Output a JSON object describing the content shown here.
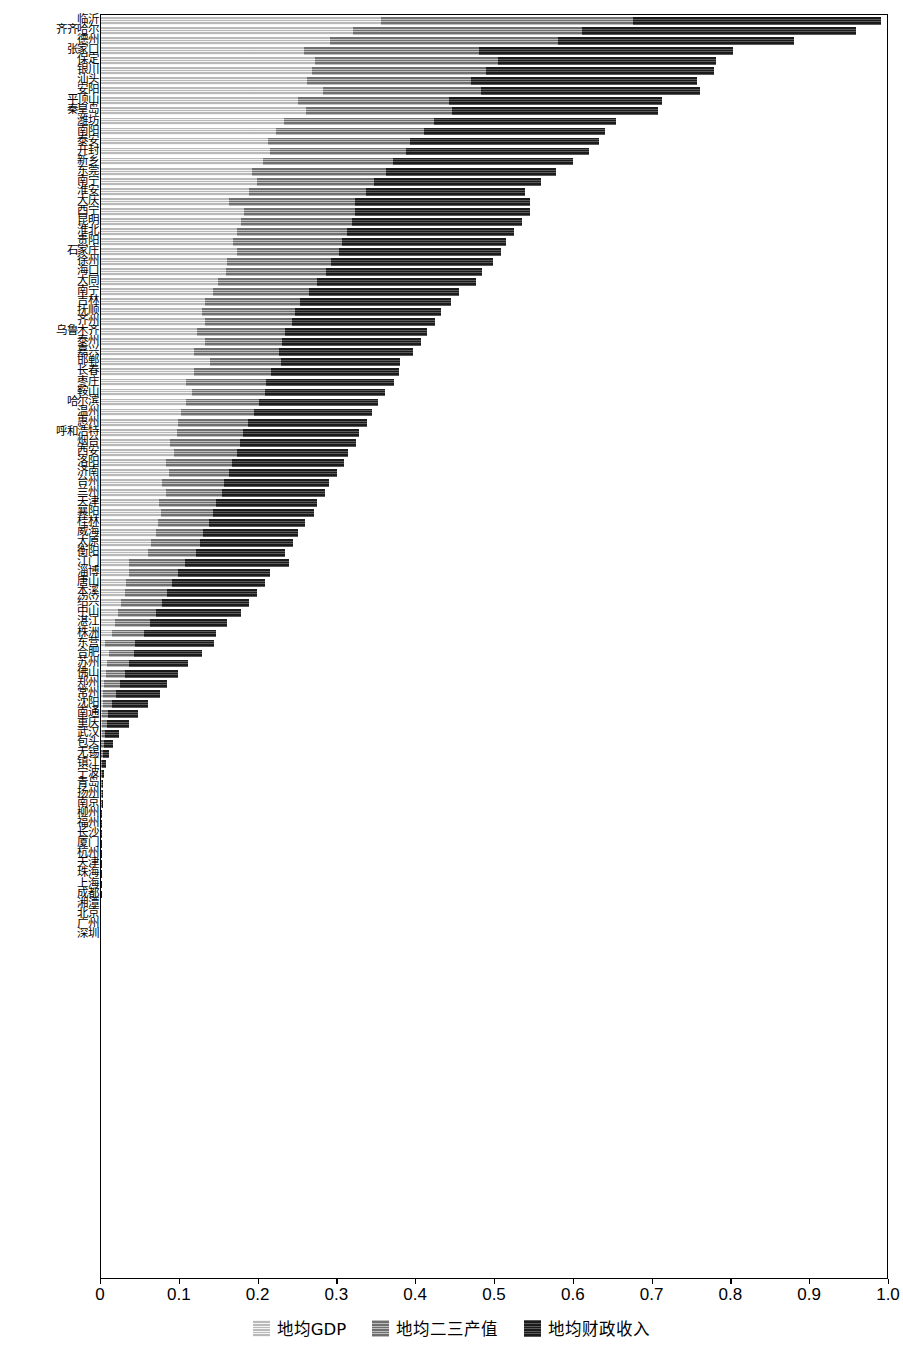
{
  "chart_data": {
    "type": "bar",
    "orientation": "horizontal",
    "stacked": true,
    "title": "",
    "subtitle": "",
    "xlabel": "",
    "ylabel": "",
    "xlim": [
      0,
      1.0
    ],
    "xticks": [
      0,
      0.1,
      0.2,
      0.3,
      0.4,
      0.5,
      0.6,
      0.7,
      0.8,
      0.9,
      1.0
    ],
    "xticklabels": [
      "0",
      "0.1",
      "0.2",
      "0.3",
      "0.4",
      "0.5",
      "0.6",
      "0.7",
      "0.8",
      "0.9",
      "1.0"
    ],
    "grid": false,
    "legend_position": "bottom-center",
    "legend": [
      {
        "name": "地均GDP",
        "color": "#b9b9b9",
        "hatch": "horizontal-lines"
      },
      {
        "name": "地均二三产值",
        "color": "#6f6f6f",
        "hatch": "horizontal-lines"
      },
      {
        "name": "地均财政收入",
        "color": "#1b1b1b",
        "hatch": "horizontal-lines"
      }
    ],
    "categories": [
      "临沂",
      "齐齐哈尔",
      "德州",
      "张家口",
      "保定",
      "银川",
      "汕头",
      "安阳",
      "平顶山",
      "秦皇岛",
      "潍坊",
      "南阳",
      "泰安",
      "开封",
      "新乡",
      "东莞",
      "南宁",
      "淮安",
      "大庆",
      "西宁",
      "昆明",
      "淮北",
      "贵阳",
      "石家庄",
      "徐州",
      "海口",
      "大同",
      "南宁",
      "吉林",
      "抚顺",
      "齐州",
      "乌鲁木齐",
      "泰州",
      "嘉兴",
      "邯郸",
      "长春",
      "枣庄",
      "鞍山",
      "哈尔滨",
      "温州",
      "惠州",
      "呼和浩特",
      "烟台",
      "西安",
      "洛阳",
      "济南",
      "台州",
      "兰州",
      "天津",
      "襄阳",
      "桂林",
      "威海",
      "太原",
      "衡阳",
      "江门",
      "淄博",
      "唐山",
      "本溪",
      "绍兴",
      "中山",
      "湛江",
      "株洲",
      "东营",
      "合肥",
      "苏州",
      "佛山",
      "郑州",
      "常州",
      "沈阳",
      "南通",
      "重庆",
      "武汉",
      "包头",
      "无锡",
      "镇江",
      "宁波",
      "青岛",
      "扬州",
      "南京",
      "柳州",
      "福州",
      "长沙",
      "厦门",
      "杭州",
      "天津",
      "珠海",
      "上海",
      "成都",
      "湘潭",
      "北京",
      "广州",
      "深圳"
    ],
    "series": [
      {
        "name": "地均GDP",
        "color": "#b9b9b9",
        "values": [
          0.355,
          0.32,
          0.29,
          0.258,
          0.272,
          0.268,
          0.262,
          0.282,
          0.25,
          0.26,
          0.232,
          0.222,
          0.212,
          0.215,
          0.205,
          0.192,
          0.198,
          0.188,
          0.162,
          0.182,
          0.178,
          0.172,
          0.168,
          0.172,
          0.16,
          0.158,
          0.148,
          0.142,
          0.132,
          0.128,
          0.132,
          0.122,
          0.132,
          0.118,
          0.138,
          0.118,
          0.108,
          0.116,
          0.108,
          0.102,
          0.098,
          0.096,
          0.088,
          0.092,
          0.082,
          0.086,
          0.078,
          0.082,
          0.074,
          0.076,
          0.072,
          0.07,
          0.064,
          0.06,
          0.036,
          0.036,
          0.032,
          0.03,
          0.026,
          0.022,
          0.018,
          0.014,
          0.005,
          0.01,
          0.008,
          0.006,
          0.004,
          0.003,
          0.002,
          0.0015,
          0.001,
          0.0008,
          0.0006,
          0.0005,
          0.0004,
          0.0004,
          0.0003,
          0.0003,
          0.0002,
          0.0002,
          0.0002,
          0.0001,
          0.0001,
          0.0001,
          0.0001,
          0.0001,
          0.0001,
          0.0001,
          5e-05,
          5e-05,
          5e-05,
          5e-05
        ]
      },
      {
        "name": "地均二三产值",
        "color": "#6f6f6f",
        "values": [
          0.32,
          0.29,
          0.29,
          0.222,
          0.232,
          0.22,
          0.208,
          0.2,
          0.192,
          0.185,
          0.19,
          0.188,
          0.18,
          0.172,
          0.166,
          0.17,
          0.148,
          0.148,
          0.16,
          0.14,
          0.14,
          0.14,
          0.138,
          0.13,
          0.132,
          0.128,
          0.126,
          0.122,
          0.12,
          0.118,
          0.11,
          0.112,
          0.098,
          0.108,
          0.09,
          0.098,
          0.102,
          0.092,
          0.092,
          0.092,
          0.088,
          0.084,
          0.088,
          0.08,
          0.084,
          0.076,
          0.078,
          0.072,
          0.072,
          0.066,
          0.065,
          0.06,
          0.062,
          0.06,
          0.07,
          0.062,
          0.058,
          0.054,
          0.052,
          0.048,
          0.044,
          0.04,
          0.038,
          0.032,
          0.028,
          0.024,
          0.02,
          0.016,
          0.012,
          0.008,
          0.006,
          0.004,
          0.003,
          0.002,
          0.0015,
          0.001,
          0.0008,
          0.0006,
          0.0005,
          0.0004,
          0.0003,
          0.0003,
          0.0002,
          0.0002,
          0.0002,
          0.0001,
          0.0001,
          0.0001,
          0.0001,
          0.0001,
          5e-05,
          5e-05
        ]
      },
      {
        "name": "地均财政收入",
        "color": "#1b1b1b",
        "values": [
          0.315,
          0.348,
          0.3,
          0.322,
          0.276,
          0.29,
          0.286,
          0.278,
          0.27,
          0.262,
          0.232,
          0.23,
          0.24,
          0.232,
          0.228,
          0.216,
          0.212,
          0.202,
          0.222,
          0.222,
          0.216,
          0.212,
          0.208,
          0.206,
          0.206,
          0.198,
          0.202,
          0.19,
          0.192,
          0.186,
          0.182,
          0.18,
          0.176,
          0.17,
          0.152,
          0.162,
          0.162,
          0.152,
          0.152,
          0.15,
          0.152,
          0.148,
          0.148,
          0.142,
          0.142,
          0.138,
          0.134,
          0.13,
          0.128,
          0.128,
          0.122,
          0.12,
          0.118,
          0.114,
          0.132,
          0.116,
          0.118,
          0.114,
          0.11,
          0.108,
          0.098,
          0.092,
          0.1,
          0.086,
          0.074,
          0.068,
          0.06,
          0.056,
          0.046,
          0.038,
          0.028,
          0.018,
          0.012,
          0.008,
          0.005,
          0.003,
          0.002,
          0.0015,
          0.001,
          0.0008,
          0.0006,
          0.0005,
          0.0004,
          0.0003,
          0.0003,
          0.0002,
          0.0002,
          0.0002,
          0.0001,
          0.0001,
          0.0001,
          0.0001
        ]
      }
    ]
  }
}
